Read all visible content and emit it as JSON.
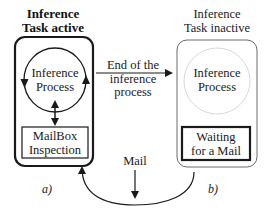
{
  "diagram": {
    "panel_a": {
      "title_line1": "Inference",
      "title_line2": "Task active",
      "process_line1": "Inference",
      "process_line2": "Process",
      "mailbox_line1": "MailBox",
      "mailbox_line2": "Inspection",
      "caption": "a)"
    },
    "panel_b": {
      "title_line1": "Inference",
      "title_line2": "Task inactive",
      "process_line1": "Inference",
      "process_line2": "Process",
      "waiting_line1": "Waiting",
      "waiting_line2": "for a Mail",
      "caption": "b)"
    },
    "transition": {
      "line1": "End of the",
      "line2": "inference",
      "line3": "process"
    },
    "mail_label": "Mail",
    "colors": {
      "ink": "#1a1a1a",
      "inactive_border": "#6a6a6a",
      "faint_circle": "#d8d8d8"
    }
  }
}
